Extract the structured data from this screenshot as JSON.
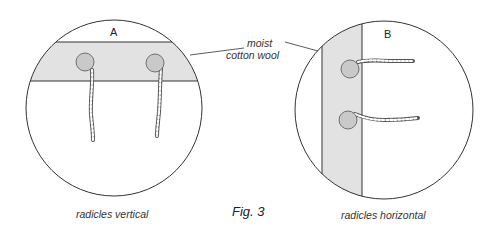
{
  "figure": {
    "caption": "Fig. 3",
    "callout_label_line1": "moist",
    "callout_label_line2": "cotton wool",
    "dish_a": {
      "letter": "A",
      "caption": "radicles vertical",
      "band_orientation": "horizontal",
      "seed_count": 2
    },
    "dish_b": {
      "letter": "B",
      "caption": "radicles horizontal",
      "band_orientation": "vertical",
      "seed_count": 2
    }
  },
  "colors": {
    "outline": "#333333",
    "cotton_wool": "#e2e2e2",
    "seed": "#c9c9c9",
    "text": "#333333"
  }
}
